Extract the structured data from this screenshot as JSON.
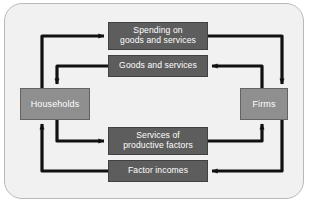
{
  "diagram": {
    "type": "circular-flow",
    "panel": {
      "background_color": "#f1f1f1",
      "border_color": "#b9b9b9"
    },
    "colors": {
      "sector_box": "#8f8f8f",
      "flow_box": "#5d5d5d",
      "arrow": "#111111",
      "label_text": "#ffffff"
    },
    "sectors": [
      {
        "id": "households",
        "label": "Households",
        "side": "left"
      },
      {
        "id": "firms",
        "label": "Firms",
        "side": "right"
      }
    ],
    "flows": [
      {
        "id": "spending",
        "label": "Spending on goods and services",
        "line1": "Spending on",
        "line2": "goods and services",
        "direction": "households-to-firms",
        "position": "top"
      },
      {
        "id": "goods",
        "label": "Goods and services",
        "line1": "Goods and services",
        "line2": "",
        "direction": "firms-to-households",
        "position": "upper-middle"
      },
      {
        "id": "services-of-productive-factors",
        "label": "Services of productive factors",
        "line1": "Services of",
        "line2": "productive factors",
        "direction": "households-to-firms",
        "position": "lower-middle"
      },
      {
        "id": "factor-incomes",
        "label": "Factor incomes",
        "line1": "Factor incomes",
        "line2": "",
        "direction": "firms-to-households",
        "position": "bottom"
      }
    ]
  }
}
